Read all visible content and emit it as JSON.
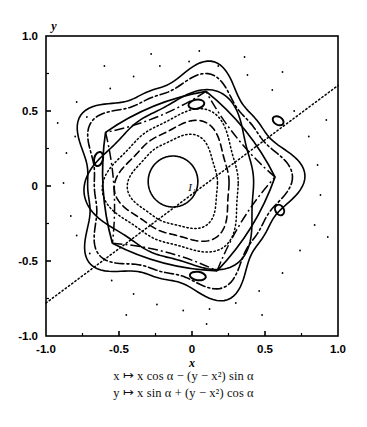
{
  "figure": {
    "kind": "phase-portrait",
    "axis_labels": {
      "x": "x",
      "y": "y"
    },
    "point_label": "I₁",
    "caption_lines": [
      "x ↦ x cos α − (y − x²) sin α",
      "y ↦ x sin α + (y − x²) cos α"
    ],
    "colors": {
      "ink": "#000000",
      "paper": "#ffffff"
    }
  },
  "chart_data": {
    "type": "scatter",
    "title": "",
    "xlabel": "x",
    "ylabel": "y",
    "xlim": [
      -1.0,
      1.0
    ],
    "ylim": [
      -1.0,
      1.0
    ],
    "grid": false,
    "legend": "none",
    "xticks": [
      -1.0,
      -0.5,
      0,
      0.5,
      1.0
    ],
    "xticklabels": [
      "-1.0",
      "-0.5",
      "0",
      "0.5",
      "1.0"
    ],
    "yticks": [
      -1.0,
      -0.5,
      0,
      0.5,
      1.0
    ],
    "yticklabels": [
      "-1.0",
      "-0.5",
      "0",
      "0.5",
      "1.0"
    ],
    "minor_ticks": [
      -0.75,
      -0.25,
      0.25,
      0.75
    ],
    "annotations": [
      {
        "text": "I₁",
        "x": 0.0,
        "y": -0.03
      }
    ],
    "series": [
      {
        "name": "inner-circle-orbit",
        "style": "solid",
        "shape": "circle",
        "center": [
          -0.13,
          0.03
        ],
        "radius": 0.17
      },
      {
        "name": "inner-dotted-orbit",
        "style": "dotted",
        "shape": "rounded-triangle",
        "center": [
          -0.1,
          0.02
        ],
        "radius": 0.3,
        "lobe": 0.035
      },
      {
        "name": "mid-dashed-orbit",
        "style": "dashed",
        "shape": "rounded-triangle",
        "center": [
          -0.09,
          0.02
        ],
        "radius": 0.38,
        "lobe": 0.05
      },
      {
        "name": "mid-dotted-orbit",
        "style": "dotted",
        "shape": "rounded-triangle",
        "center": [
          -0.09,
          0.02
        ],
        "radius": 0.45,
        "lobe": 0.06
      },
      {
        "name": "separatrix-inner",
        "style": "solid",
        "shape": "rounded-triangle",
        "center": [
          -0.08,
          0.02
        ],
        "radius": 0.56,
        "lobe": 0.08
      },
      {
        "name": "island-chain-outer",
        "style": "dashdot",
        "shape": "rounded-pentagon",
        "center": [
          -0.06,
          0.02
        ],
        "radius": 0.66,
        "lobe": 0.07
      },
      {
        "name": "outer-boundary",
        "style": "solid",
        "shape": "rounded-pentagon",
        "center": [
          -0.06,
          0.02
        ],
        "radius": 0.72,
        "lobe": 0.09
      },
      {
        "name": "unstable-manifold-line",
        "style": "dotted",
        "shape": "line",
        "from": [
          -1.0,
          -0.78
        ],
        "to": [
          1.0,
          0.67
        ]
      }
    ],
    "islands": [
      {
        "name": "island-top",
        "cx": 0.03,
        "cy": 0.545,
        "rx": 0.055,
        "ry": 0.03,
        "rot": -10
      },
      {
        "name": "island-upper-right",
        "cx": 0.59,
        "cy": 0.435,
        "rx": 0.04,
        "ry": 0.027,
        "rot": 30
      },
      {
        "name": "island-right",
        "cx": 0.6,
        "cy": -0.16,
        "rx": 0.038,
        "ry": 0.028,
        "rot": 60
      },
      {
        "name": "island-bottom",
        "cx": 0.04,
        "cy": -0.6,
        "rx": 0.055,
        "ry": 0.028,
        "rot": 8
      },
      {
        "name": "island-left",
        "cx": -0.64,
        "cy": 0.18,
        "rx": 0.03,
        "ry": 0.048,
        "rot": 15
      }
    ],
    "scatter_points": [
      [
        -0.79,
        0.56
      ],
      [
        -0.72,
        0.46
      ],
      [
        -0.8,
        0.33
      ],
      [
        -0.86,
        0.22
      ],
      [
        -0.88,
        0.02
      ],
      [
        -0.83,
        -0.2
      ],
      [
        -0.79,
        -0.33
      ],
      [
        -0.7,
        -0.45
      ],
      [
        -0.55,
        -0.63
      ],
      [
        -0.4,
        -0.72
      ],
      [
        -0.24,
        -0.79
      ],
      [
        -0.06,
        -0.83
      ],
      [
        0.12,
        -0.82
      ],
      [
        0.3,
        -0.78
      ],
      [
        0.46,
        -0.7
      ],
      [
        0.62,
        -0.58
      ],
      [
        0.74,
        -0.43
      ],
      [
        0.84,
        -0.26
      ],
      [
        0.88,
        -0.06
      ],
      [
        0.86,
        0.14
      ],
      [
        0.8,
        0.33
      ],
      [
        0.7,
        0.5
      ],
      [
        0.55,
        0.64
      ],
      [
        0.38,
        0.74
      ],
      [
        0.18,
        0.8
      ],
      [
        -0.02,
        0.83
      ],
      [
        -0.22,
        0.8
      ],
      [
        -0.4,
        0.73
      ],
      [
        -0.56,
        0.65
      ],
      [
        -0.28,
        0.88
      ],
      [
        0.05,
        0.9
      ],
      [
        0.36,
        0.86
      ],
      [
        -0.6,
        0.8
      ],
      [
        0.62,
        0.76
      ],
      [
        0.1,
        -0.92
      ],
      [
        -0.45,
        -0.86
      ],
      [
        0.48,
        -0.86
      ],
      [
        0.92,
        0.44
      ],
      [
        -0.92,
        0.42
      ],
      [
        0.93,
        -0.34
      ]
    ]
  }
}
